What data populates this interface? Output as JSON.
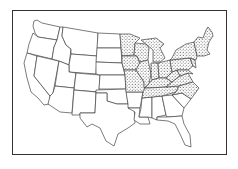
{
  "map": {
    "title": "",
    "region": "Contiguous United States",
    "pattern": "dotted",
    "dotted_states": [
      "MN",
      "IA",
      "MO",
      "WI",
      "IL",
      "MI",
      "IN",
      "OH",
      "KY",
      "TN",
      "PA",
      "NY",
      "WV",
      "VA",
      "NC",
      "MD",
      "DE",
      "NJ",
      "CT",
      "RI",
      "MA",
      "VT",
      "NH",
      "ME"
    ],
    "plain_states": [
      "WA",
      "OR",
      "CA",
      "NV",
      "ID",
      "MT",
      "WY",
      "UT",
      "CO",
      "AZ",
      "NM",
      "ND",
      "SD",
      "NE",
      "KS",
      "OK",
      "TX",
      "AR",
      "LA",
      "MS",
      "AL",
      "GA",
      "SC",
      "FL"
    ],
    "colors": {
      "outline": "#444444",
      "dots": "#222222",
      "background": "#ffffff",
      "frame": "#333333"
    }
  }
}
